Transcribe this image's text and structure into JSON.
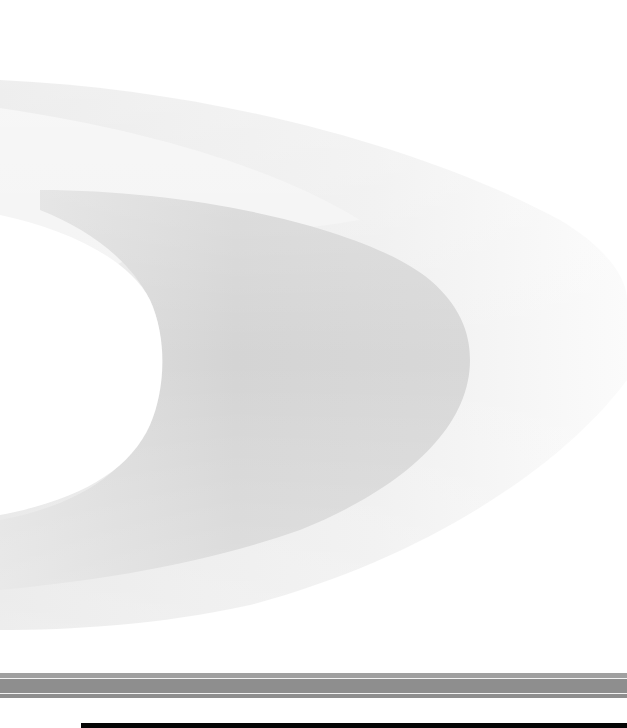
{
  "page": {
    "type": "cover",
    "background_color": "#ffffff"
  },
  "artwork": {
    "outer_band_color": "#ececec",
    "middle_band_color": "#d6d6d6",
    "inner_region_color": "#ffffff",
    "fade_color": "#f6f6f6"
  },
  "rule_bar": {
    "color": "#8e8e8e",
    "stripe_color": "#f2f2f2"
  },
  "footer_bar": {
    "color": "#050505"
  }
}
